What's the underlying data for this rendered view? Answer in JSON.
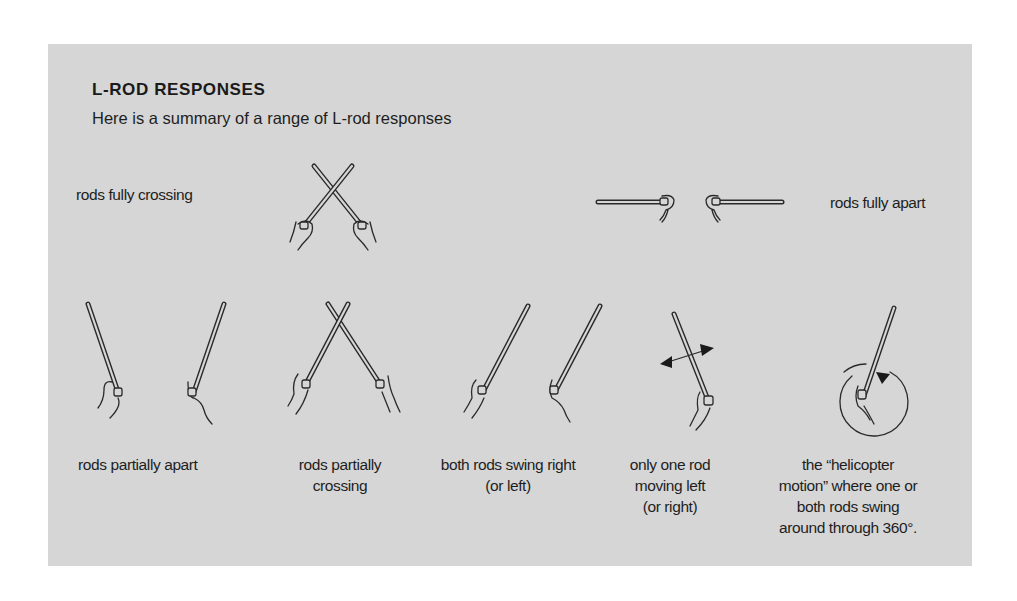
{
  "panel": {
    "title": "L-ROD RESPONSES",
    "subtitle": "Here is a summary of a range of L-rod responses",
    "background_color": "#d6d6d6"
  },
  "responses": {
    "fully_crossing": {
      "label": "rods fully crossing",
      "icon": "rods-fully-crossing-illustration"
    },
    "fully_apart": {
      "label": "rods fully apart",
      "icon": "rods-fully-apart-illustration"
    },
    "partially_apart": {
      "label": "rods partially apart",
      "icon": "rods-partially-apart-illustration"
    },
    "partially_crossing": {
      "label_line1": "rods partially",
      "label_line2": "crossing",
      "icon": "rods-partially-crossing-illustration"
    },
    "swing_right": {
      "label_line1": "both rods swing right",
      "label_line2": "(or left)",
      "icon": "rods-swing-right-illustration"
    },
    "one_rod_moving": {
      "label_line1": "only one rod",
      "label_line2": "moving left",
      "label_line3": "(or right)",
      "icon": "one-rod-moving-illustration"
    },
    "helicopter": {
      "label_line1": "the “helicopter",
      "label_line2": "motion” where one or",
      "label_line3": "both rods swing",
      "label_line4": "around through 360°.",
      "icon": "helicopter-motion-illustration"
    }
  }
}
